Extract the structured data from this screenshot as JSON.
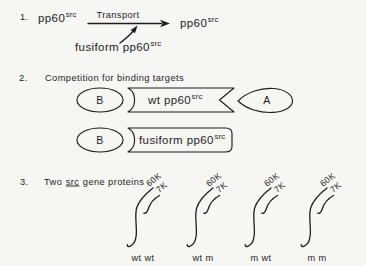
{
  "colors": {
    "background": "#f6f6f3",
    "ink": "#1e1e1e"
  },
  "section1": {
    "number": "1.",
    "left_protein_main": "pp60",
    "left_protein_sup": "src",
    "transport_label": "Transport",
    "right_protein_main": "pp60",
    "right_protein_sup": "src",
    "fusiform_label_main": "fusiform pp60",
    "fusiform_label_sup": "src"
  },
  "section2": {
    "number": "2.",
    "title": "Competition for binding targets",
    "row1": {
      "oval_label": "B",
      "banner_main": "wt pp60",
      "banner_sup": "src",
      "leaf_label": "A"
    },
    "row2": {
      "oval_label": "B",
      "box_main": "fusiform pp60",
      "box_sup": "src"
    }
  },
  "section3": {
    "number": "3.",
    "title_word1": "Two",
    "title_word2_underlined": "src",
    "title_word3": "gene proteins",
    "label_60k": "60K",
    "label_7k": "7K",
    "groups": [
      {
        "label": "wt wt"
      },
      {
        "label": "wt m"
      },
      {
        "label": "m wt"
      },
      {
        "label": "m m"
      }
    ]
  }
}
